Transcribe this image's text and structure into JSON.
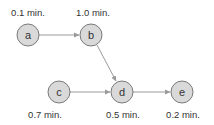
{
  "diagram": {
    "type": "precedence-graph",
    "colors": {
      "node_fill": "#d9d9d9",
      "node_stroke": "#7a7a7a",
      "edge": "#9a9a9a",
      "text": "#333333"
    },
    "nodes": [
      {
        "id": "a",
        "label": "a",
        "time": "0.1 min.",
        "time_position": "above"
      },
      {
        "id": "b",
        "label": "b",
        "time": "1.0 min.",
        "time_position": "above"
      },
      {
        "id": "c",
        "label": "c",
        "time": "0.7 min.",
        "time_position": "below"
      },
      {
        "id": "d",
        "label": "d",
        "time": "0.5 min.",
        "time_position": "below"
      },
      {
        "id": "e",
        "label": "e",
        "time": "0.2 min.",
        "time_position": "below"
      }
    ],
    "edges": [
      {
        "from": "a",
        "to": "b"
      },
      {
        "from": "b",
        "to": "d"
      },
      {
        "from": "c",
        "to": "d"
      },
      {
        "from": "d",
        "to": "e"
      }
    ]
  }
}
